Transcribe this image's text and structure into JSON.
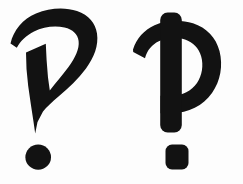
{
  "image": {
    "title": "Two hand-drawn punctuation glyphs",
    "background_color": "#fdfdfd",
    "ink_color": "#121212",
    "width": 243,
    "height": 184
  },
  "glyphs": [
    {
      "id": "left-glyph",
      "name": "question-mark-glyph",
      "description": "Hooked question-mark-like mark with tapering wedge tail and round dot",
      "parts": [
        {
          "name": "hook-arc",
          "shape": "curve"
        },
        {
          "name": "wedge-tail",
          "shape": "tapered-blade"
        },
        {
          "name": "round-dot",
          "shape": "circle",
          "center_x": 38,
          "center_y": 157,
          "diameter": 25
        }
      ]
    },
    {
      "id": "right-glyph",
      "name": "thorn-letter-glyph",
      "description": "Vertical stem with looping bowl crossing it, plus rounded-square dot",
      "parts": [
        {
          "name": "vertical-stem",
          "shape": "rounded-bar"
        },
        {
          "name": "bowl-loop",
          "shape": "closed-loop"
        },
        {
          "name": "square-dot",
          "shape": "rounded-square",
          "center_x": 177,
          "center_y": 157,
          "width": 23,
          "height": 25
        }
      ]
    }
  ]
}
